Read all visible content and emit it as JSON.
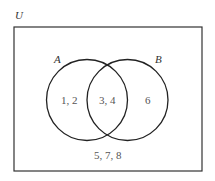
{
  "diagram": {
    "type": "venn",
    "universe_label": "U",
    "sets": [
      {
        "label": "A",
        "only_elements": "1, 2"
      },
      {
        "label": "B",
        "only_elements": "6"
      }
    ],
    "intersection_elements": "3, 4",
    "outside_elements": "5, 7, 8",
    "colors": {
      "stroke": "#222222",
      "text": "#555555",
      "background": "#ffffff"
    }
  }
}
